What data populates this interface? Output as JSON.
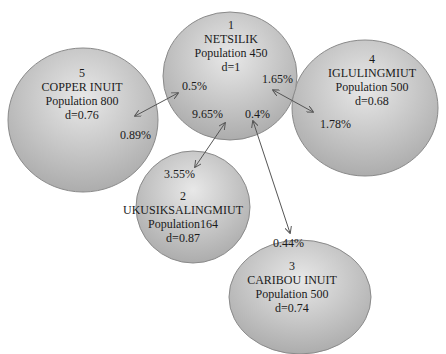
{
  "nodes": [
    {
      "id": "1",
      "name": "NETSILIK",
      "population": "Population 450",
      "d": "d=1"
    },
    {
      "id": "2",
      "name": "UKUSIKSALINGMIUT",
      "population": "Population164",
      "d": "d=0.87"
    },
    {
      "id": "3",
      "name": "CARIBOU INUIT",
      "population": "Population 500",
      "d": "d=0.74"
    },
    {
      "id": "4",
      "name": "IGLULINGMIUT",
      "population": "Population 500",
      "d": "d=0.68"
    },
    {
      "id": "5",
      "name": "COPPER INUIT",
      "population": "Population 800",
      "d": "d=0.76"
    }
  ],
  "edges": [
    {
      "from": "1",
      "to": "5",
      "from_pct": "0.5%",
      "to_pct": "0.89%"
    },
    {
      "from": "1",
      "to": "4",
      "from_pct": "1.65%",
      "to_pct": "1.78%"
    },
    {
      "from": "1",
      "to": "2",
      "from_pct": "9.65%",
      "to_pct": "3.55%"
    },
    {
      "from": "1",
      "to": "3",
      "from_pct": "0.4%",
      "to_pct": "0.44%"
    }
  ],
  "colors": {
    "circle_light": "#e6e6e6",
    "circle_dark": "#a9a9a9",
    "stroke": "#8a8a8a",
    "arrow": "#555555"
  }
}
